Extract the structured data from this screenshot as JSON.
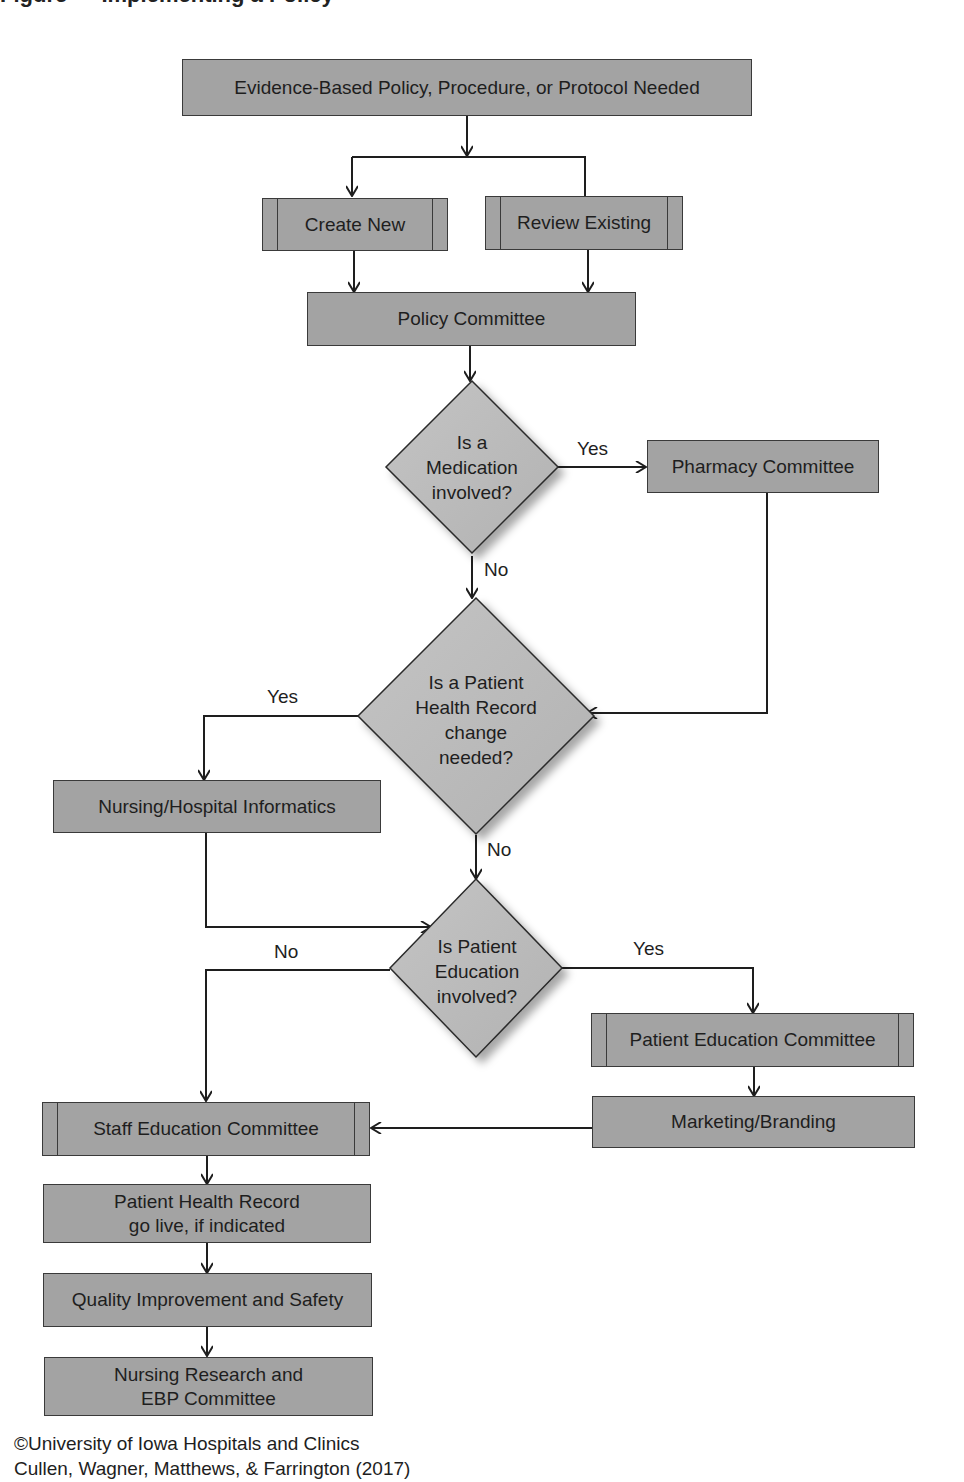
{
  "header": {
    "clipped_title": "Figure  —  Implementing a Policy"
  },
  "nodes": {
    "start": "Evidence-Based Policy, Procedure, or Protocol Needed",
    "create_new": "Create New",
    "review_existing": "Review Existing",
    "policy_committee": "Policy Committee",
    "decision_medication": [
      "Is a",
      "Medication",
      "involved?"
    ],
    "pharmacy_committee": "Pharmacy Committee",
    "decision_health_record": [
      "Is a Patient",
      "Health Record",
      "change",
      "needed?"
    ],
    "informatics": "Nursing/Hospital Informatics",
    "decision_patient_education": [
      "Is Patient",
      "Education",
      "involved?"
    ],
    "patient_education_committee": "Patient Education Committee",
    "marketing_branding": "Marketing/Branding",
    "staff_education_committee": "Staff Education Committee",
    "health_record_go_live": [
      "Patient Health Record",
      "go live, if indicated"
    ],
    "quality_improvement": "Quality Improvement and Safety",
    "nursing_research": [
      "Nursing Research and",
      "EBP Committee"
    ]
  },
  "edge_labels": {
    "medication_yes": "Yes",
    "medication_no": "No",
    "health_record_yes": "Yes",
    "health_record_no": "No",
    "education_no": "No",
    "education_yes": "Yes"
  },
  "footer": {
    "line1": "©University of Iowa Hospitals and Clinics",
    "line2": "Cullen, Wagner, Matthews, & Farrington (2017)"
  },
  "colors": {
    "box_fill": "#a3a3a3",
    "diamond_fill": "#bdbdbd",
    "line": "#1e1e1e"
  }
}
